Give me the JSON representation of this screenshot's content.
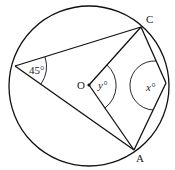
{
  "diagram": {
    "type": "circle-geometry",
    "points": {
      "C": {
        "label": "C"
      },
      "A": {
        "label": "A"
      },
      "O": {
        "label": "O"
      }
    },
    "angles": {
      "left": {
        "label": "45°"
      },
      "center": {
        "label": "y°"
      },
      "right": {
        "label": "x°"
      }
    },
    "stroke_color": "#111111"
  }
}
